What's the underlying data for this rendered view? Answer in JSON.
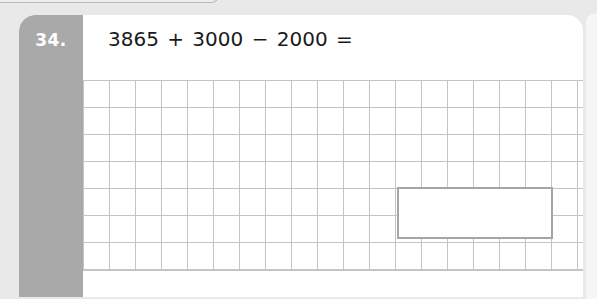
{
  "question": {
    "number": "34.",
    "expression": "3865 + 3000 − 2000 ="
  },
  "answer_box": {
    "value": ""
  },
  "colors": {
    "tab": "#a9a9a9",
    "grid_line": "#c4c4c4",
    "answer_border": "#a5a5a5",
    "background": "#e9e9e9"
  }
}
